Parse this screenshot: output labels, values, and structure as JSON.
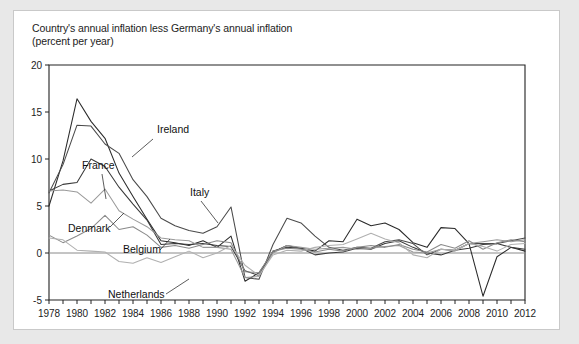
{
  "figure": {
    "title_line1": "Country's annual inflation less Germany's annual inflation",
    "title_line2": "(percent per year)",
    "background": "#ffffff",
    "page_background": "#e8e8e8"
  },
  "chart_data": {
    "type": "line",
    "xlabel": "",
    "ylabel": "percent per year",
    "grid": false,
    "legend_position": "inline-annotations",
    "xlim": [
      1978,
      2012
    ],
    "ylim": [
      -5,
      20
    ],
    "yticks": [
      -5,
      0,
      5,
      10,
      15,
      20
    ],
    "ytick_labels": [
      "-5",
      "0",
      "5",
      "10",
      "15",
      "20"
    ],
    "xticks": [
      1978,
      1980,
      1982,
      1984,
      1986,
      1988,
      1990,
      1992,
      1994,
      1996,
      1998,
      2000,
      2002,
      2004,
      2006,
      2008,
      2010,
      2012
    ],
    "xtick_labels": [
      "1978",
      "1980",
      "1982",
      "1984",
      "1986",
      "1988",
      "1990",
      "1992",
      "1994",
      "1996",
      "1998",
      "2000",
      "2002",
      "2004",
      "2006",
      "2008",
      "2010",
      "2012"
    ],
    "x": [
      1978,
      1979,
      1980,
      1981,
      1982,
      1983,
      1984,
      1985,
      1986,
      1987,
      1988,
      1989,
      1990,
      1991,
      1992,
      1993,
      1994,
      1995,
      1996,
      1997,
      1998,
      1999,
      2000,
      2001,
      2002,
      2003,
      2004,
      2005,
      2006,
      2007,
      2008,
      2009,
      2010,
      2011,
      2012
    ],
    "series": [
      {
        "name": "Ireland",
        "color": "#2b2b2b",
        "values": [
          5.0,
          9.8,
          16.4,
          14.0,
          12.2,
          8.5,
          6.0,
          3.6,
          1.3,
          1.1,
          0.8,
          1.3,
          0.6,
          1.8,
          -3.0,
          -2.1,
          0.1,
          0.8,
          0.5,
          0.2,
          1.3,
          1.2,
          3.6,
          2.9,
          3.2,
          2.5,
          1.1,
          0.6,
          2.7,
          2.6,
          1.0,
          -4.6,
          -0.4,
          0.6,
          0.2
        ]
      },
      {
        "name": "France",
        "color": "#3a3a3a",
        "values": [
          6.6,
          7.3,
          7.5,
          10.0,
          9.2,
          7.0,
          5.2,
          3.5,
          0.9,
          1.0,
          0.9,
          1.0,
          0.8,
          0.7,
          -1.9,
          -2.4,
          0.2,
          0.6,
          0.5,
          -0.2,
          0.0,
          0.1,
          0.5,
          0.4,
          1.0,
          1.3,
          0.6,
          0.0,
          -0.2,
          0.3,
          0.5,
          0.9,
          1.0,
          0.6,
          0.4
        ]
      },
      {
        "name": "Italy",
        "color": "#4a4a4a",
        "values": [
          6.4,
          9.4,
          13.6,
          13.5,
          11.6,
          10.6,
          7.8,
          6.0,
          3.7,
          2.9,
          2.4,
          2.1,
          2.8,
          4.9,
          -2.6,
          -2.8,
          0.9,
          3.7,
          3.2,
          1.8,
          0.6,
          0.3,
          0.6,
          0.5,
          1.2,
          1.4,
          1.0,
          -0.2,
          0.4,
          0.3,
          1.0,
          1.0,
          1.0,
          1.3,
          1.6
        ]
      },
      {
        "name": "Denmark",
        "color": "#9a9a9a",
        "values": [
          6.6,
          6.7,
          6.5,
          5.3,
          6.8,
          4.5,
          3.6,
          2.8,
          1.6,
          1.4,
          1.3,
          0.6,
          0.6,
          0.4,
          -2.6,
          -2.5,
          0.0,
          0.8,
          0.6,
          0.4,
          0.5,
          0.6,
          0.4,
          0.5,
          0.7,
          0.8,
          0.1,
          0.0,
          0.4,
          0.2,
          1.0,
          1.2,
          1.4,
          1.2,
          1.4
        ]
      },
      {
        "name": "Belgium",
        "color": "#8a8a8a",
        "values": [
          1.9,
          1.1,
          1.8,
          2.6,
          4.0,
          2.5,
          2.8,
          1.9,
          0.6,
          0.8,
          0.5,
          0.9,
          1.3,
          1.1,
          -2.0,
          -2.1,
          0.2,
          0.5,
          0.4,
          0.1,
          0.4,
          0.2,
          0.6,
          0.8,
          0.6,
          0.9,
          0.4,
          0.1,
          0.9,
          0.5,
          1.3,
          0.4,
          1.1,
          1.4,
          1.2
        ]
      },
      {
        "name": "Netherlands",
        "color": "#b0b0b0",
        "values": [
          1.6,
          1.4,
          0.3,
          0.2,
          0.1,
          -0.9,
          -1.1,
          -0.5,
          -1.0,
          -0.4,
          0.2,
          -0.5,
          0.0,
          0.8,
          -1.3,
          -2.4,
          -0.2,
          0.3,
          0.2,
          0.6,
          0.8,
          0.9,
          1.5,
          2.1,
          1.5,
          1.1,
          -0.2,
          -0.5,
          0.4,
          0.3,
          1.0,
          0.7,
          0.2,
          0.9,
          1.0
        ]
      }
    ],
    "annotations": [
      {
        "label": "Ireland",
        "x": 143,
        "y": 122,
        "leader": [
          [
            139,
            128
          ],
          [
            118,
            146
          ]
        ]
      },
      {
        "label": "France",
        "x": 68,
        "y": 158,
        "leader": [
          [
            88,
            163
          ],
          [
            92,
            188
          ]
        ]
      },
      {
        "label": "Italy",
        "x": 176,
        "y": 185,
        "leader": [
          [
            187,
            190
          ],
          [
            204,
            212
          ]
        ]
      },
      {
        "label": "Denmark",
        "x": 54,
        "y": 221,
        "leader": [
          [
            96,
            216
          ],
          [
            110,
            202
          ]
        ]
      },
      {
        "label": "Belgium",
        "x": 109,
        "y": 242,
        "leader": [
          [
            146,
            239
          ],
          [
            156,
            228
          ]
        ]
      },
      {
        "label": "Netherlands",
        "x": 94,
        "y": 287,
        "leader": [
          [
            152,
            283
          ],
          [
            175,
            268
          ]
        ]
      }
    ]
  }
}
